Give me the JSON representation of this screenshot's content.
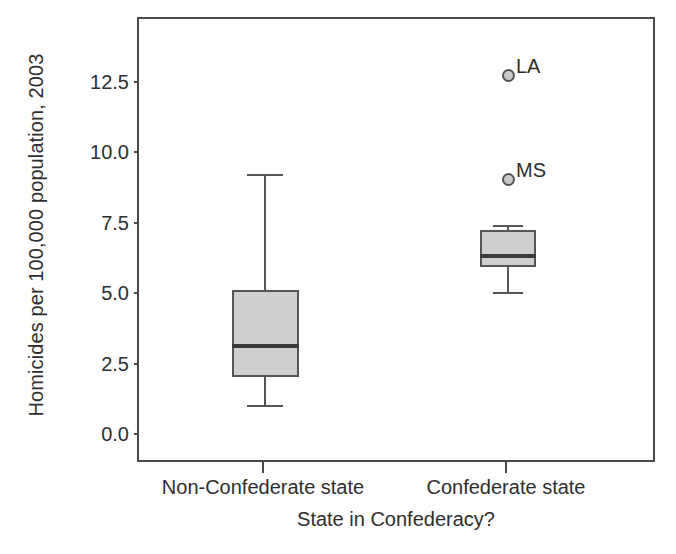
{
  "chart_data": {
    "type": "box",
    "title": "",
    "xlabel": "State in Confederacy?",
    "ylabel": "Homicides per 100,000 population, 2003",
    "categories": [
      "Non-Confederate state",
      "Confederate state"
    ],
    "ylim": [
      0.0,
      14.4
    ],
    "yticks": [
      "0.0",
      "2.5",
      "5.0",
      "7.5",
      "10.0",
      "12.5"
    ],
    "ytick_values": [
      0.0,
      2.5,
      5.0,
      7.5,
      10.0,
      12.5
    ],
    "grid": false,
    "legend": "none",
    "boxes": [
      {
        "category": "Non-Confederate state",
        "whisker_low": 1.1,
        "q1": 2.1,
        "median": 3.2,
        "q3": 5.2,
        "whisker_high": 9.3,
        "outliers": []
      },
      {
        "category": "Confederate state",
        "whisker_low": 5.1,
        "q1": 6.0,
        "median": 6.4,
        "q3": 7.3,
        "whisker_high": 7.5,
        "outliers": [
          {
            "label": "LA",
            "value": 12.8
          },
          {
            "label": "MS",
            "value": 9.1
          }
        ]
      }
    ]
  },
  "colors": {
    "box_fill": "#cfcfcf",
    "box_stroke": "#565656",
    "median": "#3a3a3a",
    "frame": "#4a4a4a",
    "text": "#2e2e2e",
    "background": "#ffffff",
    "outlier_fill": "#c9c9c9",
    "outlier_stroke": "#555555"
  }
}
